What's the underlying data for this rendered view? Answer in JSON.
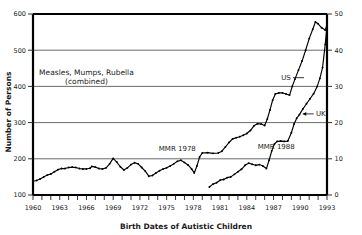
{
  "chart_data": {
    "type": "line",
    "title": "",
    "xlabel": "Birth Dates of Autistic Children",
    "ylabel": "Number of Persons",
    "ylabel_right": "",
    "xlim": [
      1960,
      1993
    ],
    "ylim": [
      100,
      600
    ],
    "ylim_right": [
      0,
      50
    ],
    "yticks": [
      100,
      200,
      300,
      400,
      500,
      600
    ],
    "yticks_right": [
      0,
      10,
      20,
      30,
      40,
      50
    ],
    "xticks": [
      1960,
      1963,
      1966,
      1969,
      1972,
      1975,
      1978,
      1981,
      1984,
      1987,
      1990,
      1993
    ],
    "xtick_minor_step": 1,
    "grid": "horizontal",
    "legend": "inline-labels",
    "annotations": [
      {
        "id": "vaccine-note",
        "text_line1": "Measles, Mumps, Rubella",
        "text_line2": "(combined)",
        "x": 1966.0,
        "y": 432
      },
      {
        "id": "mmr-1978",
        "text": "MMR 1978",
        "x": 1976.2,
        "y": 222
      },
      {
        "id": "mmr-1988",
        "text": "MMR 1988",
        "x": 1987.3,
        "y": 226
      }
    ],
    "series": [
      {
        "name": "US",
        "axis": "left",
        "label_x": 1988.4,
        "label_y": 418,
        "points": [
          [
            1960.0,
            138
          ],
          [
            1960.4,
            140
          ],
          [
            1960.8,
            144
          ],
          [
            1961.2,
            150
          ],
          [
            1961.6,
            155
          ],
          [
            1962.0,
            158
          ],
          [
            1962.4,
            164
          ],
          [
            1962.8,
            170
          ],
          [
            1963.2,
            173
          ],
          [
            1963.6,
            173
          ],
          [
            1964.0,
            176
          ],
          [
            1964.4,
            177
          ],
          [
            1964.8,
            176
          ],
          [
            1965.2,
            173
          ],
          [
            1965.6,
            172
          ],
          [
            1966.0,
            172
          ],
          [
            1966.4,
            174
          ],
          [
            1966.6,
            179
          ],
          [
            1967.0,
            177
          ],
          [
            1967.4,
            173
          ],
          [
            1967.8,
            172
          ],
          [
            1968.2,
            175
          ],
          [
            1968.6,
            186
          ],
          [
            1969.0,
            201
          ],
          [
            1969.4,
            191
          ],
          [
            1969.8,
            178
          ],
          [
            1970.2,
            169
          ],
          [
            1970.6,
            175
          ],
          [
            1971.0,
            184
          ],
          [
            1971.4,
            189
          ],
          [
            1971.8,
            186
          ],
          [
            1972.2,
            176
          ],
          [
            1972.6,
            166
          ],
          [
            1973.0,
            152
          ],
          [
            1973.4,
            154
          ],
          [
            1973.8,
            161
          ],
          [
            1974.2,
            167
          ],
          [
            1974.6,
            172
          ],
          [
            1975.0,
            175
          ],
          [
            1975.4,
            180
          ],
          [
            1975.8,
            186
          ],
          [
            1976.2,
            193
          ],
          [
            1976.6,
            196
          ],
          [
            1977.0,
            190
          ],
          [
            1977.4,
            183
          ],
          [
            1977.8,
            172
          ],
          [
            1978.1,
            161
          ],
          [
            1978.4,
            180
          ],
          [
            1978.7,
            205
          ],
          [
            1979.0,
            216
          ],
          [
            1979.6,
            217
          ],
          [
            1980.2,
            215
          ],
          [
            1980.8,
            216
          ],
          [
            1981.2,
            221
          ],
          [
            1981.6,
            233
          ],
          [
            1982.0,
            245
          ],
          [
            1982.4,
            255
          ],
          [
            1982.8,
            258
          ],
          [
            1983.2,
            261
          ],
          [
            1983.6,
            265
          ],
          [
            1984.0,
            270
          ],
          [
            1984.4,
            278
          ],
          [
            1984.8,
            291
          ],
          [
            1985.2,
            297
          ],
          [
            1985.6,
            296
          ],
          [
            1986.0,
            292
          ],
          [
            1986.3,
            310
          ],
          [
            1986.6,
            335
          ],
          [
            1986.9,
            362
          ],
          [
            1987.2,
            379
          ],
          [
            1987.6,
            382
          ],
          [
            1988.0,
            382
          ],
          [
            1988.4,
            379
          ],
          [
            1988.8,
            376
          ],
          [
            1989.1,
            400
          ],
          [
            1989.4,
            420
          ],
          [
            1989.8,
            445
          ],
          [
            1990.2,
            470
          ],
          [
            1990.6,
            500
          ],
          [
            1991.0,
            532
          ],
          [
            1991.4,
            558
          ],
          [
            1991.7,
            578
          ],
          [
            1992.0,
            573
          ],
          [
            1992.4,
            562
          ],
          [
            1992.8,
            556
          ],
          [
            1993.0,
            570
          ]
        ]
      },
      {
        "name": "UK",
        "axis": "right",
        "label_x": 1992.3,
        "label_y": 318,
        "points": [
          [
            1979.8,
            122
          ],
          [
            1980.2,
            130
          ],
          [
            1980.6,
            134
          ],
          [
            1981.0,
            141
          ],
          [
            1981.4,
            143
          ],
          [
            1981.8,
            148
          ],
          [
            1982.2,
            150
          ],
          [
            1982.6,
            157
          ],
          [
            1983.0,
            164
          ],
          [
            1983.4,
            171
          ],
          [
            1983.8,
            182
          ],
          [
            1984.2,
            188
          ],
          [
            1984.6,
            185
          ],
          [
            1985.0,
            182
          ],
          [
            1985.4,
            184
          ],
          [
            1985.8,
            180
          ],
          [
            1986.2,
            173
          ],
          [
            1986.5,
            196
          ],
          [
            1986.8,
            222
          ],
          [
            1987.1,
            241
          ],
          [
            1987.4,
            248
          ],
          [
            1987.8,
            249
          ],
          [
            1988.2,
            248
          ],
          [
            1988.6,
            249
          ],
          [
            1989.0,
            272
          ],
          [
            1989.3,
            296
          ],
          [
            1989.6,
            312
          ],
          [
            1989.9,
            322
          ],
          [
            1990.3,
            338
          ],
          [
            1990.7,
            352
          ],
          [
            1991.1,
            366
          ],
          [
            1991.5,
            380
          ],
          [
            1991.9,
            400
          ],
          [
            1992.2,
            422
          ],
          [
            1992.5,
            452
          ],
          [
            1992.8,
            516
          ],
          [
            1993.0,
            568
          ]
        ]
      }
    ]
  },
  "axis": {
    "left_title": "Number of Persons",
    "bottom_title": "Birth Dates of Autistic Children"
  },
  "labels": {
    "us": "US",
    "uk": "UK",
    "mmr_1978": "MMR 1978",
    "mmr_1988": "MMR 1988",
    "vaccine_line1": "Measles, Mumps, Rubella",
    "vaccine_line2": "(combined)"
  },
  "colors": {
    "background": "#ffffff",
    "line": "#000000",
    "grid": "#5a5a5a",
    "frame": "#000000",
    "text": "#1a1a1a"
  }
}
